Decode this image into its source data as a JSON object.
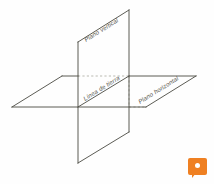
{
  "figure": {
    "background_color": "#fefefe",
    "line_color": "#4a4a42",
    "hidden_line_color": "#a9a9a0",
    "labels": {
      "vertical_plane": "Plano vertical",
      "ground_line": "Línea de tierra",
      "horizontal_plane": "Plano horizontal"
    }
  },
  "watermark": {
    "icon": "chat-bubble-icon",
    "color": "#ef8022",
    "dot_color": "#ffffff"
  },
  "geometry": {
    "vertical_plane": {
      "points": "78,42 129,10 129,132 78,163",
      "description": "vertical-plane-parallelogram"
    },
    "horizontal_plane": {
      "points": "12,107 62,76 196,76 146,107",
      "description": "horizontal-plane-parallelogram"
    },
    "ground_line": {
      "x1": 78,
      "y1": 92,
      "x2": 129,
      "y2": 60,
      "description": "ground-line-intersection"
    },
    "solid_edges": [
      "M 78,42 L 129,10",
      "M 129,10 L 129,132",
      "M 78,163 L 129,132",
      "M 78,42 L 78,163",
      "M 12,107 L 62,76",
      "M 62,76 L 78,76",
      "M 129,76 L 196,76",
      "M 196,76 L 146,107",
      "M 12,107 L 78,107",
      "M 78,107 L 146,107"
    ],
    "hidden_edges": [
      "M 78,76 L 129,76",
      "M 129,76 L 129,107",
      "M 129,107 L 129,76"
    ]
  }
}
